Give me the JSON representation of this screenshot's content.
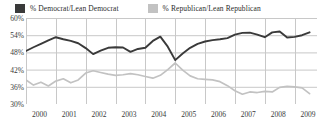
{
  "legend": {
    "position": "top",
    "items": [
      {
        "label": "% Democrat/Lean Democrat",
        "color": "#3a3a3a",
        "icon": "square-swatch"
      },
      {
        "label": "% Republican/Lean Republican",
        "color": "#c2c2c2",
        "icon": "square-swatch"
      }
    ]
  },
  "axes": {
    "y_ticks": [
      "60%",
      "54%",
      "48%",
      "42%",
      "36%",
      "30%"
    ],
    "x_ticks": [
      "2000",
      "2001",
      "2002",
      "2003",
      "2004",
      "2005",
      "2006",
      "2007",
      "2008",
      "2009"
    ]
  },
  "chart_data": {
    "type": "line",
    "title": "",
    "subtitle": "",
    "xlabel": "",
    "ylabel": "",
    "ylim": [
      30,
      60
    ],
    "ytick_values": [
      60,
      54,
      48,
      42,
      36,
      30
    ],
    "xlim": [
      2000,
      2009.75
    ],
    "xtick_values": [
      2000,
      2001,
      2002,
      2003,
      2004,
      2005,
      2006,
      2007,
      2008,
      2009
    ],
    "grid": true,
    "grid_color": "#c8c8c8",
    "legend_position": "top",
    "series": [
      {
        "name": "% Democrat/Lean Democrat",
        "color": "#3a3a3a",
        "x": [
          2000.0,
          2000.25,
          2000.5,
          2000.75,
          2001.0,
          2001.25,
          2001.5,
          2001.75,
          2002.0,
          2002.25,
          2002.5,
          2002.75,
          2003.0,
          2003.25,
          2003.5,
          2003.75,
          2004.0,
          2004.25,
          2004.5,
          2004.75,
          2005.0,
          2005.25,
          2005.5,
          2005.75,
          2006.0,
          2006.25,
          2006.5,
          2006.75,
          2007.0,
          2007.25,
          2007.5,
          2007.75,
          2008.0,
          2008.25,
          2008.5,
          2008.75,
          2009.0,
          2009.25,
          2009.5
        ],
        "values": [
          48.5,
          49.8,
          51.0,
          52.2,
          53.3,
          52.6,
          52.0,
          51.2,
          49.5,
          47.4,
          48.6,
          49.6,
          49.8,
          49.7,
          48.2,
          49.2,
          49.6,
          52.0,
          53.5,
          50.0,
          45.3,
          47.6,
          49.6,
          51.0,
          51.8,
          52.3,
          52.6,
          53.0,
          54.2,
          54.8,
          54.9,
          54.2,
          53.3,
          55.0,
          55.3,
          53.2,
          53.4,
          54.0,
          55.0
        ]
      },
      {
        "name": "% Republican/Lean Republican",
        "color": "#c2c2c2",
        "x": [
          2000.0,
          2000.25,
          2000.5,
          2000.75,
          2001.0,
          2001.25,
          2001.5,
          2001.75,
          2002.0,
          2002.25,
          2002.5,
          2002.75,
          2003.0,
          2003.25,
          2003.5,
          2003.75,
          2004.0,
          2004.25,
          2004.5,
          2004.75,
          2005.0,
          2005.25,
          2005.5,
          2005.75,
          2006.0,
          2006.25,
          2006.5,
          2006.75,
          2007.0,
          2007.25,
          2007.5,
          2007.75,
          2008.0,
          2008.25,
          2008.5,
          2008.75,
          2009.0,
          2009.25,
          2009.5
        ],
        "values": [
          38.4,
          36.6,
          37.6,
          36.3,
          38.0,
          38.8,
          37.4,
          38.4,
          40.8,
          41.6,
          41.0,
          40.4,
          40.0,
          40.2,
          40.6,
          40.2,
          39.6,
          39.0,
          40.0,
          42.0,
          44.3,
          41.8,
          39.8,
          38.8,
          38.6,
          38.4,
          37.8,
          36.4,
          34.6,
          33.4,
          34.2,
          34.0,
          34.4,
          34.2,
          35.8,
          36.2,
          36.0,
          35.6,
          33.6
        ]
      }
    ]
  }
}
